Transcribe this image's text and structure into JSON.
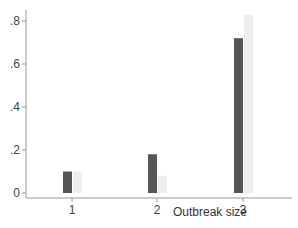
{
  "chart_data": {
    "type": "bar",
    "title": "",
    "xlabel": "Outbreak size",
    "ylabel": "",
    "categories": [
      "1",
      "2",
      "3"
    ],
    "series": [
      {
        "name": "Series A",
        "color": "#555555",
        "values": [
          0.1,
          0.18,
          0.72
        ]
      },
      {
        "name": "Series B",
        "color": "#eeeeee",
        "values": [
          0.1,
          0.08,
          0.83
        ]
      }
    ],
    "ylim": [
      0,
      0.85
    ],
    "yticks": [
      0,
      0.2,
      0.4,
      0.6,
      0.8
    ],
    "ytick_labels": [
      "0",
      ".2",
      ".4",
      ".6",
      ".8"
    ],
    "grid": false,
    "legend": null
  },
  "colors": {
    "axis": "#999999",
    "dark_bar": "#555555",
    "light_bar": "#eeeeee"
  }
}
